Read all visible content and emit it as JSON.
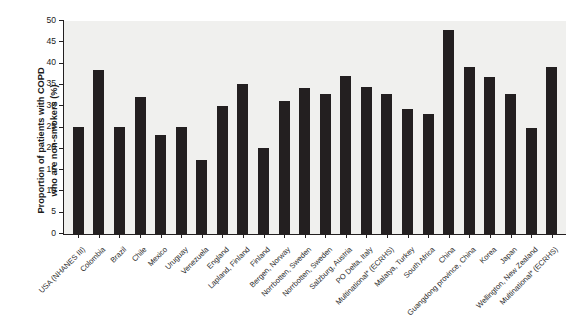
{
  "chart_data": {
    "type": "bar",
    "title": "",
    "subtitle": "",
    "xlabel": "",
    "ylabel": "Proportion of patients with COPD\nwho are non-smokers (%)",
    "ylim": [
      0,
      50
    ],
    "yticks": [
      0,
      5,
      10,
      15,
      20,
      25,
      30,
      35,
      40,
      45,
      50
    ],
    "grid": false,
    "legend": "none",
    "bar_color": "#231f20",
    "plot_background": "#f0f0ee",
    "footnote": "",
    "categories": [
      "USA (NHANES III)",
      "Colombia",
      "Brazil",
      "Chile",
      "Mexico",
      "Uruguay",
      "Venezuela",
      "England",
      "Lapland, Finland",
      "Finland",
      "Bergen, Norway",
      "Norrbotten, Sweden",
      "Norrbotten, Sweden",
      "Salzburg, Austria",
      "PO Delta, Italy",
      "Multinational* (ECRHS)",
      "Malatya, Turkey",
      "South Africa",
      "China",
      "Guangdong province, China",
      "Korea",
      "Japan",
      "Wellington, New Zealand",
      "Multinational* (ECRHS)"
    ],
    "values": [
      25.2,
      38.5,
      25.1,
      32.2,
      23.3,
      25.2,
      17.3,
      30.1,
      35.3,
      20.3,
      31.2,
      34.2,
      32.8,
      37.0,
      34.4,
      32.8,
      29.3,
      28.2,
      48.0,
      39.3,
      36.9,
      32.8,
      25.0,
      39.3
    ]
  }
}
